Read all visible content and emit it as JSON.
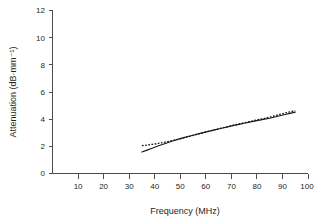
{
  "chart_data": {
    "type": "line",
    "title": "",
    "xlabel": "Frequency (MHz)",
    "ylabel": "Attenuation (dB·mm⁻¹)",
    "xlim": [
      0,
      100
    ],
    "ylim": [
      0,
      12
    ],
    "xticks": [
      10,
      20,
      30,
      40,
      50,
      60,
      70,
      80,
      90,
      100
    ],
    "yticks": [
      0,
      2,
      4,
      6,
      8,
      10,
      12
    ],
    "xtick_labels": [
      "10",
      "20",
      "30",
      "40",
      "50",
      "60",
      "70",
      "80",
      "90",
      "100"
    ],
    "ytick_labels": [
      "0",
      "2",
      "4",
      "6",
      "8",
      "10",
      "12"
    ],
    "grid": false,
    "legend": false,
    "legend_position": "none",
    "series": [
      {
        "name": "measured-attenuation-solid",
        "style": "solid",
        "color": "#1a1a1a",
        "x": [
          35,
          37,
          39,
          41,
          43,
          45,
          47,
          49,
          51,
          53,
          55,
          57,
          59,
          61,
          63,
          65,
          67,
          69,
          71,
          73,
          75,
          77,
          79,
          81,
          83,
          85,
          87,
          89,
          91,
          93,
          95
        ],
        "y": [
          1.58,
          1.72,
          1.86,
          2.0,
          2.13,
          2.26,
          2.39,
          2.51,
          2.62,
          2.72,
          2.82,
          2.92,
          3.01,
          3.1,
          3.19,
          3.28,
          3.37,
          3.45,
          3.54,
          3.62,
          3.7,
          3.78,
          3.86,
          3.93,
          4.0,
          4.07,
          4.16,
          4.25,
          4.34,
          4.43,
          4.52
        ]
      },
      {
        "name": "model-fit-dotted",
        "style": "dotted",
        "color": "#1a1a1a",
        "x": [
          35,
          37,
          39,
          41,
          43,
          45,
          47,
          49,
          51,
          53,
          55,
          57,
          59,
          61,
          63,
          65,
          67,
          69,
          71,
          73,
          75,
          77,
          79,
          81,
          83,
          85,
          87,
          89,
          91,
          93,
          95
        ],
        "y": [
          2.05,
          2.09,
          2.14,
          2.2,
          2.27,
          2.35,
          2.43,
          2.51,
          2.6,
          2.7,
          2.8,
          2.9,
          3.0,
          3.1,
          3.2,
          3.29,
          3.38,
          3.47,
          3.56,
          3.65,
          3.73,
          3.81,
          3.9,
          3.98,
          4.06,
          4.15,
          4.25,
          4.35,
          4.45,
          4.54,
          4.62
        ]
      }
    ]
  },
  "figure": {
    "background_color": "#ffffff",
    "axis_color": "#4d4d4d",
    "text_color": "#231f20"
  }
}
